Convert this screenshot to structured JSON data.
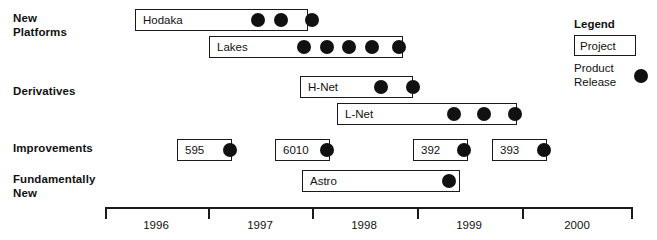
{
  "chart_data": {
    "type": "gantt",
    "title": "",
    "xlabel": "",
    "ylabel": "",
    "axis": {
      "tick_labels": [
        "1996",
        "1997",
        "1998",
        "1999",
        "2000"
      ],
      "range_start": 1996,
      "range_end": 2001,
      "grid": false
    },
    "categories": [
      "New\nPlatforms",
      "Derivatives",
      "Improvements",
      "Fundamentally\nNew"
    ],
    "series": [
      {
        "name": "Hodaka",
        "category": "New Platforms",
        "start": 1996.3,
        "end": 1997.97,
        "releases": [
          1997.41,
          1997.63,
          1997.93
        ]
      },
      {
        "name": "Lakes",
        "category": "New Platforms",
        "start": 1997.02,
        "end": 1998.9,
        "releases": [
          1997.93,
          1998.18,
          1998.4,
          1998.62,
          1998.86
        ]
      },
      {
        "name": "H-Net",
        "category": "Derivatives",
        "start": 1997.97,
        "end": 1999.0,
        "releases": [
          1998.61,
          1998.94
        ]
      },
      {
        "name": "L-Net",
        "category": "Derivatives",
        "start": 1998.32,
        "end": 2000.06,
        "releases": [
          1999.31,
          1999.6,
          1999.99
        ]
      },
      {
        "name": "595",
        "category": "Improvements",
        "start": 1996.7,
        "end": 1997.23,
        "releases": [
          1997.18
        ]
      },
      {
        "name": "6010",
        "category": "Improvements",
        "start": 1997.65,
        "end": 1998.18,
        "releases": [
          1998.13
        ]
      },
      {
        "name": "392",
        "category": "Improvements",
        "start": 1999.03,
        "end": 1999.56,
        "releases": [
          1999.51
        ]
      },
      {
        "name": "393",
        "category": "Improvements",
        "start": 1999.79,
        "end": 2000.33,
        "releases": [
          2000.28
        ]
      },
      {
        "name": "Astro",
        "category": "Fundamentally New",
        "start": 1997.89,
        "end": 1999.42,
        "releases": [
          1999.37
        ]
      }
    ]
  },
  "rows": [
    {
      "label": "New\nPlatforms",
      "top": 12
    },
    {
      "label": "Derivatives",
      "top": 85
    },
    {
      "label": "Improvements",
      "top": 142
    },
    {
      "label": "Fundamentally\nNew",
      "top": 173
    }
  ],
  "bars": [
    {
      "name": "Hodaka",
      "left": 135,
      "top": 9,
      "width": 173,
      "dots": [
        258,
        281,
        312
      ]
    },
    {
      "name": "Lakes",
      "left": 209,
      "top": 36,
      "width": 194,
      "dots": [
        304,
        327,
        349,
        372,
        399
      ]
    },
    {
      "name": "H-Net",
      "left": 300,
      "top": 76,
      "width": 113,
      "dots": [
        381,
        413
      ]
    },
    {
      "name": "L-Net",
      "left": 337,
      "top": 103,
      "width": 180,
      "dots": [
        454,
        484,
        515
      ]
    },
    {
      "name": "595",
      "left": 177,
      "top": 139,
      "width": 55,
      "dots": [
        230
      ]
    },
    {
      "name": "6010",
      "left": 275,
      "top": 139,
      "width": 55,
      "dots": [
        327
      ]
    },
    {
      "name": "392",
      "left": 413,
      "top": 139,
      "width": 55,
      "dots": [
        464
      ]
    },
    {
      "name": "393",
      "left": 492,
      "top": 139,
      "width": 55,
      "dots": [
        544
      ]
    }
  ],
  "astro_bar": {
    "name": "Astro",
    "left": 302,
    "top": 170,
    "width": 158,
    "dots": [
      449
    ]
  },
  "legend": {
    "title": "Legend",
    "project_label": "Project",
    "release_label": "Product\nRelease"
  },
  "axis_geometry": {
    "baseline_left": 105,
    "baseline_top": 207,
    "baseline_width": 528,
    "end_cap_height": 12,
    "tick_positions": [
      208,
      312,
      417,
      522
    ],
    "label_positions": [
      156,
      260,
      364,
      469,
      577
    ]
  },
  "colors": {
    "ink": "#111111",
    "stroke": "#1a1a1a",
    "background": "#ffffff"
  }
}
